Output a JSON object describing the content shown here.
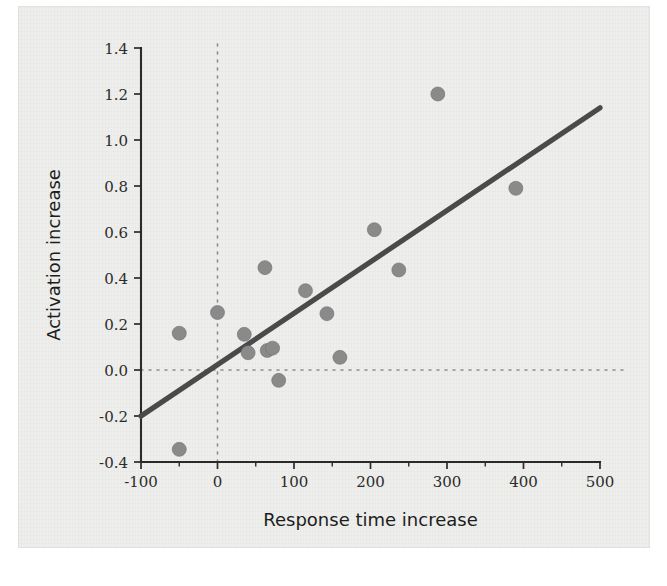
{
  "figure": {
    "kind": "scatter-plot-scan",
    "background_color": "#eeeeec",
    "page_color": "#ffffff"
  },
  "chart_data": {
    "type": "scatter",
    "title": "",
    "subtitle": "",
    "xlabel": "Response time increase",
    "ylabel": "Activation increase",
    "xlim": [
      -100,
      500
    ],
    "ylim": [
      -0.4,
      1.4
    ],
    "xticks": [
      -100,
      0,
      100,
      200,
      300,
      400,
      500
    ],
    "xtick_labels": [
      "-100",
      "0",
      "100",
      "200",
      "300",
      "400",
      "500"
    ],
    "xminor_ticks": [
      -50,
      50,
      150,
      250,
      350,
      450
    ],
    "yticks": [
      -0.4,
      -0.2,
      0.0,
      0.2,
      0.4,
      0.6,
      0.8,
      1.0,
      1.2,
      1.4
    ],
    "ytick_labels": [
      "-0.4",
      "-0.2",
      "0.0",
      "0.2",
      "0.4",
      "0.6",
      "0.8",
      "1.0",
      "1.2",
      "1.4"
    ],
    "grid": false,
    "legend": "none",
    "reference_lines": [
      {
        "name": "zero-horizontal",
        "orientation": "horizontal",
        "value": 0.0,
        "style": "dotted",
        "color": "#8e8e8e"
      },
      {
        "name": "zero-vertical",
        "orientation": "vertical",
        "value": 0,
        "style": "dotted",
        "color": "#8e8e8e"
      }
    ],
    "fit_line": {
      "name": "regression-line",
      "style": "solid",
      "color": "#4a4a4a",
      "x_start": -100,
      "y_start": -0.2,
      "x_end": 500,
      "y_end": 1.14,
      "slope": 0.002233,
      "intercept": 0.0233
    },
    "point_color": "#8a8a8a",
    "point_radius_px": 7,
    "x": [
      -50,
      -50,
      0,
      35,
      40,
      62,
      65,
      72,
      80,
      115,
      143,
      160,
      205,
      237,
      288,
      390
    ],
    "y": [
      0.16,
      -0.345,
      0.25,
      0.155,
      0.075,
      0.445,
      0.085,
      0.095,
      -0.045,
      0.345,
      0.245,
      0.055,
      0.61,
      0.435,
      1.2,
      0.79
    ],
    "points": [
      {
        "x": -50,
        "y": 0.16
      },
      {
        "x": -50,
        "y": -0.345
      },
      {
        "x": 0,
        "y": 0.25
      },
      {
        "x": 35,
        "y": 0.155
      },
      {
        "x": 40,
        "y": 0.075
      },
      {
        "x": 62,
        "y": 0.445
      },
      {
        "x": 65,
        "y": 0.085
      },
      {
        "x": 72,
        "y": 0.095
      },
      {
        "x": 80,
        "y": -0.045
      },
      {
        "x": 115,
        "y": 0.345
      },
      {
        "x": 143,
        "y": 0.245
      },
      {
        "x": 160,
        "y": 0.055
      },
      {
        "x": 205,
        "y": 0.61
      },
      {
        "x": 237,
        "y": 0.435
      },
      {
        "x": 288,
        "y": 1.2
      },
      {
        "x": 390,
        "y": 0.79
      }
    ]
  }
}
